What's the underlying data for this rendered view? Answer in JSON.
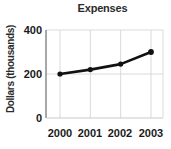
{
  "chart_data": {
    "type": "line",
    "title": "Expenses",
    "xlabel": "",
    "ylabel": "Dollars (thousands)",
    "categories": [
      "2000",
      "2001",
      "2002",
      "2003"
    ],
    "values": [
      200,
      220,
      245,
      300
    ],
    "x": [
      2000,
      2001,
      2002,
      2003
    ],
    "ylim": [
      0,
      400
    ],
    "yticks": [
      0,
      200,
      400
    ],
    "ytick_labels": [
      "0",
      "200",
      "400"
    ],
    "xtick_labels": [
      "2000",
      "2001",
      "2002",
      "2003"
    ],
    "grid": true,
    "grid_color": "#d9d9d9",
    "legend": false,
    "legend_position": "none",
    "line_color": "#111111",
    "marker": "circle",
    "marker_color": "#111111",
    "background": "#ffffff",
    "axis_color": "#b5b5b5"
  },
  "figure": {
    "title": "Expenses",
    "ylabel": "Dollars (thousands)"
  }
}
